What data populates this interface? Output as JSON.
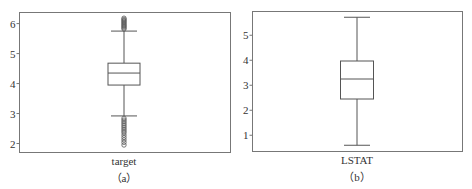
{
  "chart_data": [
    {
      "type": "box",
      "caption": "（a）",
      "xlabel": "target",
      "ylabel": "",
      "yticks": [
        2,
        3,
        4,
        5,
        6
      ],
      "ylim": [
        1.7,
        6.37
      ],
      "grid": false,
      "box": {
        "category": "target",
        "whisker_low": 2.92,
        "q1": 3.95,
        "median": 4.35,
        "q3": 4.68,
        "whisker_high": 5.75,
        "outliers_high": [
          5.82,
          5.86,
          5.9,
          5.94,
          5.98,
          6.02,
          6.06,
          6.1,
          6.14,
          6.18
        ],
        "outliers_low": [
          2.84,
          2.78,
          2.72,
          2.66,
          2.6,
          2.54,
          2.48,
          2.42,
          2.36,
          2.28,
          2.2,
          2.12,
          2.04,
          1.95
        ]
      }
    },
    {
      "type": "box",
      "caption": "（b）",
      "xlabel": "LSTAT",
      "ylabel": "",
      "yticks": [
        1,
        2,
        3,
        4,
        5
      ],
      "ylim": [
        0.35,
        5.95
      ],
      "grid": false,
      "box": {
        "category": "LSTAT",
        "whisker_low": 0.6,
        "q1": 2.45,
        "median": 3.25,
        "q3": 3.97,
        "whisker_high": 5.72,
        "outliers_high": [],
        "outliers_low": []
      }
    }
  ]
}
